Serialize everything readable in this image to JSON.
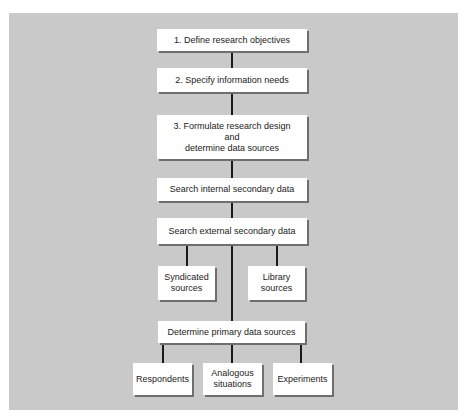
{
  "diagram": {
    "type": "flowchart",
    "colors": {
      "panel": "#c9c9c9",
      "box": "#ffffff",
      "line": "#1a1a1a",
      "shadow": "#6e6e6e"
    },
    "steps": [
      {
        "id": "define",
        "lines": [
          "1.  Define research objectives"
        ]
      },
      {
        "id": "specify",
        "lines": [
          "2.  Specify information needs"
        ]
      },
      {
        "id": "formulate",
        "lines": [
          "3.  Formulate research design",
          "and",
          "determine data sources"
        ]
      },
      {
        "id": "internal",
        "lines": [
          "Search internal secondary data"
        ]
      },
      {
        "id": "external",
        "lines": [
          "Search external secondary data"
        ]
      },
      {
        "id": "syndicated",
        "lines": [
          "Syndicated",
          "sources"
        ]
      },
      {
        "id": "library",
        "lines": [
          "Library",
          "sources"
        ]
      },
      {
        "id": "primary",
        "lines": [
          "Determine primary data sources"
        ]
      },
      {
        "id": "respondents",
        "lines": [
          "Respondents"
        ]
      },
      {
        "id": "analogous",
        "lines": [
          "Analogous",
          "situations"
        ]
      },
      {
        "id": "experiments",
        "lines": [
          "Experiments"
        ]
      }
    ]
  }
}
